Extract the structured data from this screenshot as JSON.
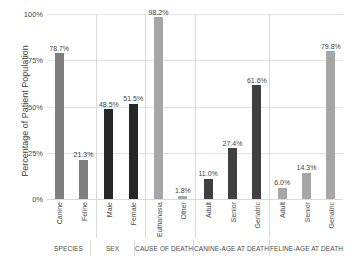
{
  "chart_data": {
    "type": "bar",
    "title": "",
    "xlabel": "",
    "ylabel": "Percentage of Patient Population",
    "ylim": [
      0,
      100
    ],
    "yticks": [
      "0%",
      "25%",
      "50%",
      "75%",
      "100%"
    ],
    "ytick_values": [
      0,
      25,
      50,
      75,
      100
    ],
    "grid": true,
    "legend": "none",
    "groups": [
      {
        "name": "SPECIES",
        "color": "#7f7f7f",
        "categories": [
          "Canine",
          "Feline"
        ],
        "values": [
          78.7,
          21.3
        ],
        "labels": [
          "78.7%",
          "21.3%"
        ]
      },
      {
        "name": "SEX",
        "color": "#262626",
        "categories": [
          "Male",
          "Female"
        ],
        "values": [
          48.5,
          51.5
        ],
        "labels": [
          "48.5%",
          "51.5%"
        ]
      },
      {
        "name": "CAUSE OF DEATH",
        "color": "#a6a6a6",
        "categories": [
          "Euthanasia",
          "Other"
        ],
        "values": [
          98.2,
          1.8
        ],
        "labels": [
          "98.2%",
          "1.8%"
        ]
      },
      {
        "name": "CANINE-AGE AT DEATH",
        "color": "#404040",
        "categories": [
          "Adult",
          "Senior",
          "Geriatric"
        ],
        "values": [
          11.0,
          27.4,
          61.6
        ],
        "labels": [
          "11.0%",
          "27.4%",
          "61.6%"
        ]
      },
      {
        "name": "FELINE-AGE AT DEATH",
        "color": "#a6a6a6",
        "categories": [
          "Adult",
          "Senior",
          "Geriatric"
        ],
        "values": [
          6.0,
          14.3,
          79.8
        ],
        "labels": [
          "6.0%",
          "14.3%",
          "79.8%"
        ]
      }
    ]
  }
}
